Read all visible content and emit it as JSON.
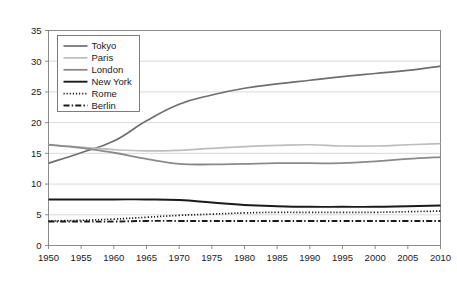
{
  "chart_data": {
    "type": "line",
    "title": "",
    "xlabel": "",
    "ylabel": "",
    "xlim": [
      1950,
      2010
    ],
    "ylim": [
      0,
      35
    ],
    "grid": true,
    "legend_position": "top-left",
    "x": [
      1950,
      1955,
      1960,
      1965,
      1970,
      1975,
      1980,
      1985,
      1990,
      1995,
      2000,
      2005,
      2010
    ],
    "xticklabels": [
      "1950",
      "1955",
      "1960",
      "1965",
      "1970",
      "1975",
      "1980",
      "1985",
      "1990",
      "1995",
      "2000",
      "2005",
      "2010"
    ],
    "yticklabels": [
      "0",
      "5",
      "10",
      "15",
      "20",
      "25",
      "30",
      "35"
    ],
    "yticks": [
      0,
      5,
      10,
      15,
      20,
      25,
      30,
      35
    ],
    "series": [
      {
        "name": "Tokyo",
        "color": "#6e6e6e",
        "width": 1.7,
        "dash": "none",
        "values": [
          13.4,
          15.1,
          17.0,
          20.3,
          23.0,
          24.5,
          25.6,
          26.3,
          26.9,
          27.5,
          28.0,
          28.5,
          29.2
        ]
      },
      {
        "name": "Paris",
        "color": "#bdbdbd",
        "width": 1.7,
        "dash": "none",
        "values": [
          16.4,
          16.0,
          15.6,
          15.4,
          15.5,
          15.8,
          16.1,
          16.3,
          16.4,
          16.2,
          16.2,
          16.4,
          16.6
        ]
      },
      {
        "name": "London",
        "color": "#8a8a8a",
        "width": 1.8,
        "dash": "none",
        "values": [
          16.4,
          15.9,
          15.1,
          14.1,
          13.3,
          13.2,
          13.3,
          13.4,
          13.4,
          13.4,
          13.7,
          14.1,
          14.4
        ]
      },
      {
        "name": "New York",
        "color": "#1a1a1a",
        "width": 1.9,
        "dash": "none",
        "values": [
          7.5,
          7.5,
          7.5,
          7.5,
          7.4,
          7.0,
          6.6,
          6.4,
          6.3,
          6.3,
          6.3,
          6.4,
          6.5
        ]
      },
      {
        "name": "Rome",
        "color": "#1a1a1a",
        "width": 1.7,
        "dash": "1.2,1.9",
        "values": [
          4.0,
          4.1,
          4.3,
          4.6,
          4.9,
          5.1,
          5.3,
          5.4,
          5.4,
          5.4,
          5.4,
          5.5,
          5.6
        ]
      },
      {
        "name": "Berlin",
        "color": "#1a1a1a",
        "width": 1.9,
        "dash": "6,2.2,1.4,2.2",
        "values": [
          3.9,
          3.9,
          3.9,
          4.0,
          4.0,
          4.0,
          4.0,
          4.0,
          4.0,
          4.0,
          4.0,
          4.0,
          4.0
        ]
      }
    ]
  },
  "legend": {
    "items": [
      {
        "label": "Tokyo"
      },
      {
        "label": "Paris"
      },
      {
        "label": "London"
      },
      {
        "label": "New York"
      },
      {
        "label": "Rome"
      },
      {
        "label": "Berlin"
      }
    ]
  }
}
